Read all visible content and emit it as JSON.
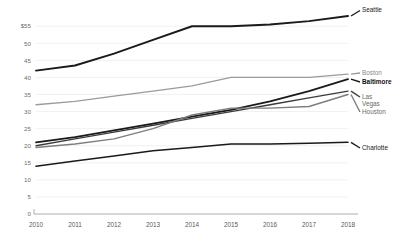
{
  "chart_data": {
    "type": "line",
    "title": "",
    "xlabel": "",
    "ylabel": "",
    "x": [
      2010,
      2011,
      2012,
      2013,
      2014,
      2015,
      2016,
      2017,
      2018
    ],
    "categories": [
      "2010",
      "2011",
      "2012",
      "2013",
      "2014",
      "2015",
      "2016",
      "2017",
      "2018"
    ],
    "ylim": [
      0,
      58
    ],
    "yticks": [
      0,
      5,
      10,
      15,
      20,
      25,
      30,
      35,
      40,
      45,
      50,
      55
    ],
    "ytick_labels": [
      "0",
      "5",
      "10",
      "15",
      "20",
      "25",
      "30",
      "35",
      "40",
      "45",
      "50",
      "$55"
    ],
    "grid": true,
    "legend_position": "right-inline-end-labels",
    "series": [
      {
        "name": "Seattle",
        "label": "Seattle",
        "color": "#1a1a1a",
        "width": 1.9,
        "bold_label": false,
        "label_color": "#1a1a1a",
        "values": [
          42,
          43.5,
          47,
          51,
          55,
          55,
          55.5,
          56.5,
          58
        ]
      },
      {
        "name": "Boston",
        "label": "Boston",
        "color": "#9b9b9b",
        "width": 1.3,
        "bold_label": false,
        "label_color": "#8a8a8a",
        "values": [
          32,
          33,
          34.5,
          36,
          37.5,
          40,
          40,
          40,
          41
        ]
      },
      {
        "name": "Baltimore",
        "label": "Baltimore",
        "color": "#1a1a1a",
        "width": 1.8,
        "bold_label": true,
        "label_color": "#121212",
        "values": [
          21,
          22.5,
          24.5,
          26.5,
          28.5,
          30.5,
          33,
          36,
          39.5
        ]
      },
      {
        "name": "Las Vegas",
        "label": "Las Vegas",
        "color": "#3a3a3a",
        "width": 1.4,
        "bold_label": false,
        "label_color": "#6a6a6a",
        "values": [
          20,
          22,
          24,
          26,
          28,
          30,
          32,
          34,
          36
        ]
      },
      {
        "name": "Houston",
        "label": "Houston",
        "color": "#7d7d7d",
        "width": 1.4,
        "bold_label": false,
        "label_color": "#6a6a6a",
        "values": [
          19.5,
          20.5,
          22,
          25,
          29,
          31,
          31,
          31.5,
          35
        ]
      },
      {
        "name": "Charlotte",
        "label": "Charlotte",
        "color": "#1a1a1a",
        "width": 1.5,
        "bold_label": false,
        "label_color": "#1a1a1a",
        "values": [
          14,
          15.5,
          17,
          18.5,
          19.5,
          20.5,
          20.5,
          20.7,
          21
        ]
      }
    ],
    "end_labels": [
      {
        "series": "Seattle",
        "text": "Seattle",
        "lines": [
          "Seattle"
        ],
        "y": 10.5,
        "bold": false,
        "color": "#1a1a1a"
      },
      {
        "series": "Boston",
        "text": "Boston",
        "lines": [
          "Boston"
        ],
        "y": 73.0,
        "bold": false,
        "color": "#8a8a8a"
      },
      {
        "series": "Baltimore",
        "text": "Baltimore",
        "lines": [
          "Baltimore"
        ],
        "y": 82.0,
        "bold": true,
        "color": "#121212"
      },
      {
        "series": "LasVegas",
        "text": "Las Vegas",
        "lines": [
          "Las",
          "Vegas"
        ],
        "y": 97.0,
        "bold": false,
        "color": "#6a6a6a"
      },
      {
        "series": "Houston",
        "text": "Houston",
        "lines": [
          "Houston"
        ],
        "y": 112.0,
        "bold": false,
        "color": "#6a6a6a"
      },
      {
        "series": "Charlotte",
        "text": "Charlotte",
        "lines": [
          "Charlotte"
        ],
        "y": 148.0,
        "bold": false,
        "color": "#1a1a1a"
      }
    ],
    "axis_color": "#9a9a9a",
    "grid_color": "#e9e9e9",
    "background": "#ffffff"
  }
}
